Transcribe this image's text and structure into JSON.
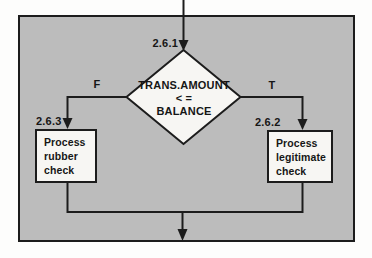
{
  "flowchart": {
    "decision": {
      "id": "2.6.1",
      "lines": [
        "TRANS.AMOUNT",
        "< =",
        "BALANCE"
      ]
    },
    "branches": {
      "false_label": "F",
      "true_label": "T"
    },
    "left_process": {
      "id": "2.6.3",
      "lines": [
        "Process",
        "rubber",
        "check"
      ]
    },
    "right_process": {
      "id": "2.6.2",
      "lines": [
        "Process",
        "legitimate",
        "check"
      ]
    },
    "colors": {
      "panel_gray": "#bcbcbc",
      "shape_fill": "#f7f6f3",
      "line_black": "#1c1c1c",
      "page_white": "#fdfdfc"
    }
  }
}
